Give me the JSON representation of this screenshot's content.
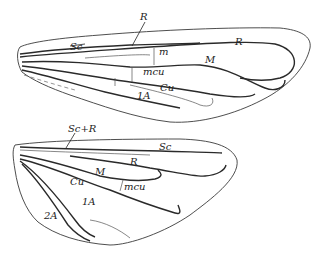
{
  "figure": {
    "forewing": {
      "labels": {
        "sc": "Sc",
        "r_top": "R",
        "r": "R",
        "m": "M",
        "rm": "m",
        "mcu": "mcu",
        "cu": "Cu",
        "a1": "1A"
      }
    },
    "hindwing": {
      "labels": {
        "scr": "Sc+R",
        "sc": "Sc",
        "r": "R",
        "m": "M",
        "cu": "Cu",
        "mcu": "mcu",
        "a1": "1A",
        "a2": "2A"
      }
    }
  }
}
